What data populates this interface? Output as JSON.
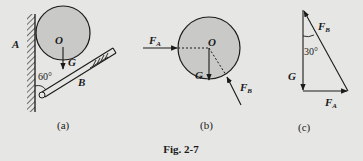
{
  "figure": {
    "caption": "Fig. 2-7",
    "background": "#e6e6e4",
    "ink": "#1a1a1a",
    "circle_fill": "#c9c9c7"
  },
  "panel_a": {
    "sublabel": "(a)",
    "labels": {
      "wall_point": "A",
      "center": "O",
      "weight": "G",
      "angle": "60°",
      "contact": "B"
    }
  },
  "panel_b": {
    "sublabel": "(b)",
    "labels": {
      "center": "O",
      "weight": "G",
      "force_a": "F",
      "force_a_sub": "A",
      "force_b": "F",
      "force_b_sub": "B"
    }
  },
  "panel_c": {
    "sublabel": "(c)",
    "labels": {
      "force_b": "F",
      "force_b_sub": "B",
      "angle": "30°",
      "weight": "G",
      "force_a": "F",
      "force_a_sub": "A"
    }
  }
}
